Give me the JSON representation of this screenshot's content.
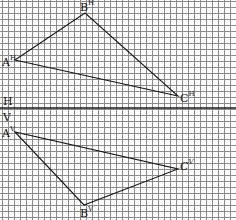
{
  "diagram": {
    "type": "orthographic-projection",
    "grid": {
      "spacing_px": 6,
      "color": "#8a8a8a"
    },
    "line_color": "#1a1a1a",
    "axis": {
      "y": 108,
      "label_top": "H",
      "label_bottom": "V"
    },
    "horizontal_projection": {
      "points": [
        {
          "name": "A",
          "sup": "H",
          "x": 15,
          "y": 60
        },
        {
          "name": "B",
          "sup": "H",
          "x": 85,
          "y": 13
        },
        {
          "name": "C",
          "sup": "H",
          "x": 178,
          "y": 96
        }
      ]
    },
    "vertical_projection": {
      "points": [
        {
          "name": "A",
          "sup": "V",
          "x": 15,
          "y": 132
        },
        {
          "name": "B",
          "sup": "V",
          "x": 84,
          "y": 205
        },
        {
          "name": "C",
          "sup": "V",
          "x": 178,
          "y": 169
        }
      ]
    }
  }
}
